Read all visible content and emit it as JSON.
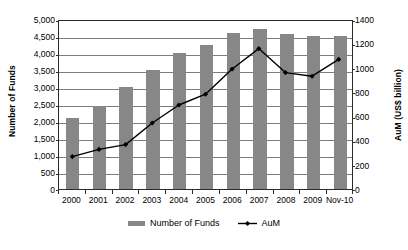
{
  "chart_data": {
    "type": "bar",
    "title": "",
    "xlabel": "",
    "categories": [
      "2000",
      "2001",
      "2002",
      "2003",
      "2004",
      "2005",
      "2006",
      "2007",
      "2008",
      "2009",
      "Nov-10"
    ],
    "grid": true,
    "legend_position": "bottom",
    "series": [
      {
        "name": "Number of Funds",
        "type": "bar",
        "axis": "left",
        "color": "#878787",
        "values": [
          2100,
          2450,
          3000,
          3500,
          4000,
          4250,
          4600,
          4700,
          4550,
          4500,
          4500
        ]
      },
      {
        "name": "AuM",
        "type": "line",
        "axis": "right",
        "color": "#000000",
        "marker": "diamond",
        "values": [
          270,
          330,
          370,
          550,
          700,
          790,
          1000,
          1170,
          970,
          940,
          1080
        ]
      }
    ],
    "left_axis": {
      "label": "Number of Funds",
      "ylim": [
        0,
        5000
      ],
      "tick_step": 500,
      "ticks": [
        "0",
        "500",
        "1,000",
        "1,500",
        "2,000",
        "2,500",
        "3,000",
        "3,500",
        "4,000",
        "4,500",
        "5,000"
      ]
    },
    "right_axis": {
      "label": "AuM (US$ billion)",
      "ylim": [
        0,
        1400
      ],
      "tick_step": 200,
      "ticks": [
        "0",
        "200",
        "400",
        "600",
        "800",
        "1000",
        "1200",
        "1400"
      ]
    },
    "legend": [
      {
        "label": "Number of Funds",
        "marker": "bar-swatch",
        "color": "#878787"
      },
      {
        "label": "AuM",
        "marker": "line-diamond",
        "color": "#000000"
      }
    ]
  },
  "colors": {
    "bar": "#878787",
    "line": "#000000",
    "grid": "#7d7d7d",
    "frame": "#2b2b2b",
    "background": "#ffffff"
  },
  "bleed_text": ""
}
